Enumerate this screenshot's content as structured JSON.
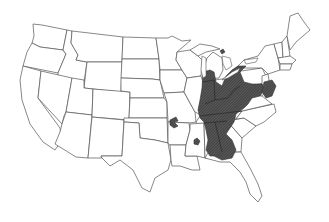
{
  "map": {
    "type": "species-range-map",
    "region": "Contiguous United States",
    "style": "black-and-white state outline map",
    "colors": {
      "background": "#ffffff",
      "state_border": "#555555",
      "range_fill": "#4a4a4a",
      "range_hatch": "#2a2a2a"
    },
    "range": {
      "description": "Shaded distribution in eastern United States",
      "states_covered": [
        "Wisconsin (east)",
        "Illinois",
        "Indiana",
        "Ohio",
        "Michigan (south)",
        "Pennsylvania (west)",
        "West Virginia",
        "Kentucky",
        "Tennessee",
        "Virginia (west)",
        "North Carolina (west)",
        "Maryland",
        "Delaware",
        "New Jersey (south)",
        "Mississippi",
        "Alabama",
        "Georgia (north)",
        "Florida panhandle (west)"
      ],
      "outliers": [
        "Ozark region (Missouri/Oklahoma/Arkansas border)",
        "Arkansas (south-central)",
        "Michigan Upper Peninsula spot"
      ]
    },
    "labels": []
  }
}
